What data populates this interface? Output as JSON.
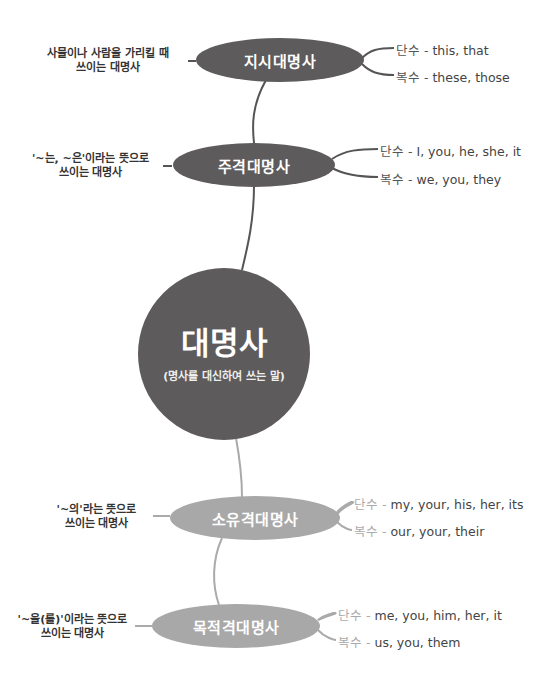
{
  "colors": {
    "dark_node": "#5e5b5c",
    "light_node": "#a9a8a8",
    "dark_line": "#555555",
    "light_line": "#aaaaaa"
  },
  "center": {
    "title": "대명사",
    "subtitle": "(명사를 대신하여 쓰는 말)"
  },
  "nodes": [
    {
      "label": "지시대명사",
      "description": [
        "사물이나 사람을 가리킬 때",
        "쓰이는 대명사"
      ],
      "singular_key": "단수 -",
      "singular": "this, that",
      "plural_key": "복수 -",
      "plural": "these, those"
    },
    {
      "label": "주격대명사",
      "description": [
        "'~는, ~은'이라는 뜻으로",
        "쓰이는 대명사"
      ],
      "singular_key": "단수 -",
      "singular": "I, you, he, she, it",
      "plural_key": "복수 -",
      "plural": "we, you, they"
    },
    {
      "label": "소유격대명사",
      "description": [
        "'~의'라는 뜻으로",
        "쓰이는 대명사"
      ],
      "singular_key": "단수 -",
      "singular": "my, your, his, her, its",
      "plural_key": "복수 -",
      "plural": "our, your, their"
    },
    {
      "label": "목적격대명사",
      "description": [
        "'~을(를)'이라는 뜻으로",
        "쓰이는 대명사"
      ],
      "singular_key": "단수 -",
      "singular": "me, you, him, her, it",
      "plural_key": "복수 -",
      "plural": "us, you, them"
    }
  ]
}
